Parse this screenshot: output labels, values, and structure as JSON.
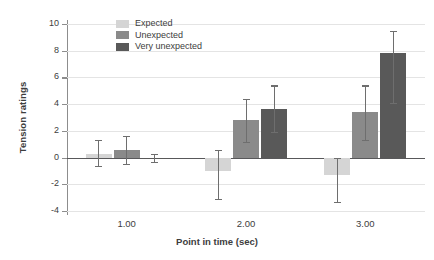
{
  "chart_data": {
    "type": "bar",
    "title": "",
    "xlabel": "Point in time (sec)",
    "ylabel": "Tension ratings",
    "categories": [
      "1.00",
      "2.00",
      "3.00"
    ],
    "ylim": [
      -4,
      10
    ],
    "yticks": [
      -4,
      -2,
      0,
      2,
      4,
      6,
      8,
      10
    ],
    "ytick_labels": [
      "-4",
      "-2",
      "0",
      "2",
      "4",
      "6",
      "8",
      "10"
    ],
    "grid": true,
    "legend_position": "top-left-inside",
    "series": [
      {
        "name": "Expected",
        "color": "#d5d5d5",
        "values": [
          0.3,
          -1.0,
          -1.3
        ],
        "err_low": [
          -0.6,
          -3.1,
          -3.3
        ],
        "err_high": [
          1.3,
          0.6,
          0.0
        ]
      },
      {
        "name": "Unexpected",
        "color": "#8a8a8a",
        "values": [
          0.55,
          2.8,
          3.4
        ],
        "err_low": [
          -0.5,
          1.2,
          1.3
        ],
        "err_high": [
          1.6,
          4.4,
          5.4
        ]
      },
      {
        "name": "Very unexpected",
        "color": "#595959",
        "values": [
          0.0,
          3.6,
          7.8
        ],
        "err_low": [
          -0.3,
          1.9,
          4.1
        ],
        "err_high": [
          0.3,
          5.4,
          9.5
        ]
      }
    ]
  },
  "legend": {
    "items": [
      {
        "label": "Expected"
      },
      {
        "label": "Unexpected"
      },
      {
        "label": "Very unexpected"
      }
    ]
  },
  "axes": {
    "y_title": "Tension ratings",
    "x_title": "Point in time (sec)"
  }
}
